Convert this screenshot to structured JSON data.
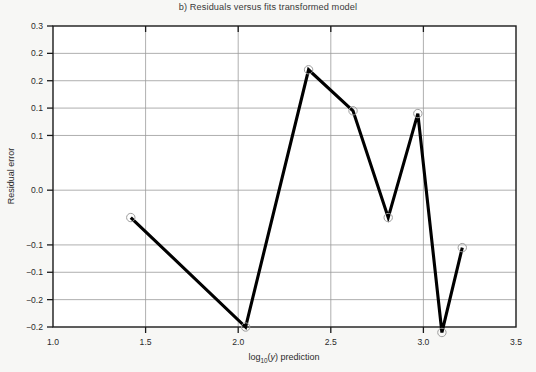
{
  "chart_data": {
    "type": "line",
    "title": "b) Residuals versus fits transformed model",
    "xlabel": "log10(y) prediction",
    "xlabel_parts": {
      "prefix": "log",
      "sub": "10",
      "mid": "(",
      "italic": "y",
      "suffix": ") prediction"
    },
    "ylabel": "Residual error",
    "xlim": [
      1.0,
      3.5
    ],
    "ylim": [
      -0.25,
      0.3
    ],
    "grid": "horizontal",
    "legend": "none",
    "markers": "open-circle",
    "x_ticks": [
      1.0,
      1.5,
      2.0,
      2.5,
      3.0,
      3.5
    ],
    "x_tick_labels": [
      "1.0",
      "1.5",
      "2.0",
      "2.5",
      "3.0",
      "3.5"
    ],
    "y_ticks": [
      0.3,
      0.25,
      0.2,
      0.15,
      0.1,
      0.05,
      0.0,
      -0.05,
      -0.1,
      -0.15,
      -0.2,
      -0.25
    ],
    "y_tick_labels": [
      "0.3",
      "0.2",
      "0.2",
      "0.1",
      "0.1",
      "0.0",
      "0.0",
      "-0.1",
      "-0.1",
      "-0.2",
      "-0.2",
      "-0.2"
    ],
    "y_tick_labels_shown": [
      "0.3",
      "0.2",
      "0.2",
      "0.1",
      "0.1",
      "0.0",
      "−0.1",
      "−0.1",
      "−0.2",
      "−0.2"
    ],
    "y_ticks_shown": [
      0.3,
      0.25,
      0.2,
      0.15,
      0.1,
      0.0,
      -0.1,
      -0.15,
      -0.2,
      -0.25
    ],
    "series": [
      {
        "name": "residuals",
        "color": "#000000",
        "x": [
          1.42,
          2.04,
          2.38,
          2.62,
          2.81,
          2.97,
          3.1,
          3.21
        ],
        "y": [
          -0.05,
          -0.25,
          0.22,
          0.145,
          -0.05,
          0.14,
          -0.26,
          -0.105
        ]
      }
    ]
  },
  "colors": {
    "background": "#f7f7f5",
    "plot_background": "#ffffff",
    "grid": "#9a9a9a",
    "axis": "#1a1a1a",
    "line": "#000000",
    "marker_ring": "#9d9d9d",
    "text": "#2a2a2a"
  }
}
